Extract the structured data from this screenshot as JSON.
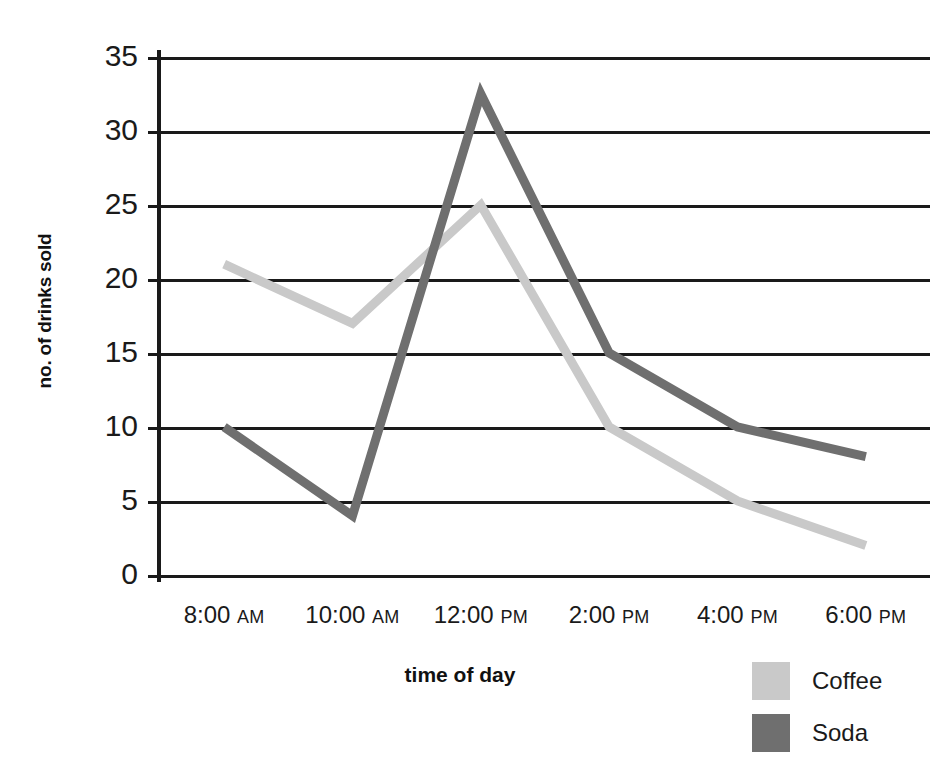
{
  "chart_data": {
    "type": "line",
    "title": "",
    "xlabel": "time of day",
    "ylabel": "no. of drinks sold",
    "categories": [
      "8:00 AM",
      "10:00 AM",
      "12:00 PM",
      "2:00 PM",
      "4:00 PM",
      "6:00 PM"
    ],
    "series": [
      {
        "name": "Coffee",
        "values": [
          21,
          17,
          25,
          10,
          5,
          2
        ],
        "color": "#c9c9c9"
      },
      {
        "name": "Soda",
        "values": [
          10,
          4,
          32.5,
          15,
          10,
          8
        ],
        "color": "#6f6f6f"
      }
    ],
    "ylim": [
      0,
      35
    ],
    "yticks": [
      0,
      5,
      10,
      15,
      20,
      25,
      30,
      35
    ],
    "ytick_labels": [
      "0",
      "5",
      "10",
      "15",
      "20",
      "25",
      "30",
      "35"
    ],
    "grid": true,
    "legend_position": "bottom-right"
  },
  "axes": {
    "x_tick_parts": [
      {
        "time": "8:00",
        "meridiem": "AM"
      },
      {
        "time": "10:00",
        "meridiem": "AM"
      },
      {
        "time": "12:00",
        "meridiem": "PM"
      },
      {
        "time": "2:00",
        "meridiem": "PM"
      },
      {
        "time": "4:00",
        "meridiem": "PM"
      },
      {
        "time": "6:00",
        "meridiem": "PM"
      }
    ]
  },
  "legend": {
    "items": [
      {
        "label": "Coffee",
        "color": "#c9c9c9"
      },
      {
        "label": "Soda",
        "color": "#6f6f6f"
      }
    ]
  },
  "colors": {
    "axis": "#1a1a1a",
    "grid": "#1a1a1a",
    "background": "#ffffff",
    "coffee": "#c9c9c9",
    "soda": "#6f6f6f"
  }
}
